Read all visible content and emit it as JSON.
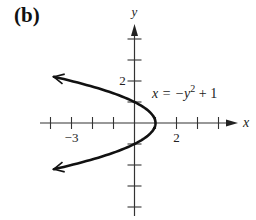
{
  "panel_label": "(b)",
  "chart_data": {
    "type": "line",
    "title": "",
    "equation": "x = -y² + 1",
    "equation_parts": {
      "lhs": "x = −y",
      "exp": "2",
      "rhs": " + 1"
    },
    "xlabel": "x",
    "ylabel": "y",
    "x_tick_labels": [
      {
        "value": -3,
        "text": "−3"
      },
      {
        "value": 2,
        "text": "2"
      }
    ],
    "y_tick_labels": [
      {
        "value": 2,
        "text": "2"
      }
    ],
    "x_ticks": [
      -4,
      -3,
      -2,
      -1,
      1,
      2,
      3,
      4
    ],
    "y_ticks": [
      -4,
      -3,
      -2,
      -1,
      1,
      2,
      3,
      4
    ],
    "xlim": [
      -4.5,
      4.8
    ],
    "ylim": [
      -4.5,
      4.7
    ],
    "grid": false,
    "series": [
      {
        "name": "x = -y^2 + 1",
        "y_range": [
          -2.2,
          2.2
        ],
        "arrows_both_ends": true,
        "points": [
          [
            -3.84,
            -2.2
          ],
          [
            -3,
            -2
          ],
          [
            -1.25,
            -1.5
          ],
          [
            0,
            -1
          ],
          [
            0.75,
            -0.5
          ],
          [
            1,
            0
          ],
          [
            0.75,
            0.5
          ],
          [
            0,
            1
          ],
          [
            -1.25,
            1.5
          ],
          [
            -3,
            2
          ],
          [
            -3.84,
            2.2
          ]
        ]
      }
    ]
  }
}
